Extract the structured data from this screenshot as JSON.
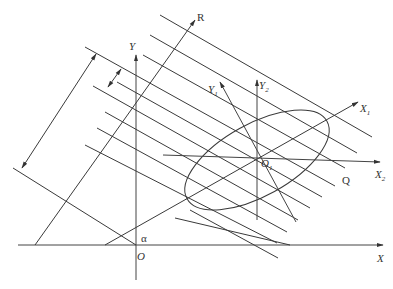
{
  "diagram": {
    "title": "",
    "labels": {
      "x_axis": "X",
      "y_axis": "Y",
      "origin": "O",
      "angle": "α",
      "r_axis": "R",
      "q_label": "Q",
      "x1_axis": "X",
      "x1_sub": "1",
      "x2_axis": "X",
      "x2_sub": "2",
      "y1_axis": "Y",
      "y1_sub": "1",
      "y2_axis": "Y",
      "y2_sub": "2",
      "o1_label": "O",
      "o1_sub": "1"
    },
    "elements": [
      "coordinate axes X-Y with origin O",
      "rotated axis R at angle α from X",
      "family of parallel lines perpendicular to R",
      "ellipse centered at O1",
      "local axes X1 (along ellipse major axis), Y1, X2, Y2",
      "dimension arrows indicating line spacing and total width"
    ],
    "colors": {
      "stroke": "#3a3a3a",
      "text": "#333333",
      "background": "#ffffff"
    }
  }
}
